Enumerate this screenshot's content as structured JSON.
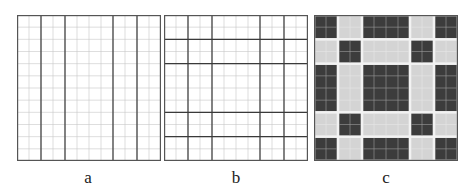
{
  "figure": {
    "grid_cells": 12,
    "group_sizes": [
      2,
      2,
      4,
      2,
      2
    ],
    "colors": {
      "fine_line": "#c8c8c8",
      "thick_line": "#3a3a3a",
      "border": "#555555",
      "dark_block": "#3c3c3c",
      "light_block": "#d4d4d4",
      "block_gap": "#f2f2f2"
    },
    "panels": [
      {
        "id": "a",
        "label": "a",
        "description": "12x12 fine grid with thick vertical dividers only"
      },
      {
        "id": "b",
        "label": "b",
        "description": "12x12 fine grid with thick vertical and horizontal dividers"
      },
      {
        "id": "c",
        "label": "c",
        "description": "5x5 block pattern; dark blocks where row+col even, light elsewhere"
      }
    ],
    "panel_c_pattern": [
      [
        "dark",
        "light",
        "dark",
        "light",
        "dark"
      ],
      [
        "light",
        "dark",
        "light",
        "dark",
        "light"
      ],
      [
        "dark",
        "light",
        "dark",
        "light",
        "dark"
      ],
      [
        "light",
        "dark",
        "light",
        "dark",
        "light"
      ],
      [
        "dark",
        "light",
        "dark",
        "light",
        "dark"
      ]
    ]
  }
}
